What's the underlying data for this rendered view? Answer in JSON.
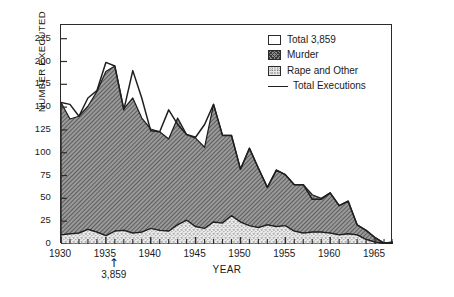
{
  "chart_data": {
    "type": "area",
    "title": "",
    "xlabel": "YEAR",
    "ylabel": "NUMBER EXECUTED",
    "xlim": [
      1930,
      1967
    ],
    "ylim": [
      0,
      240
    ],
    "x_ticks": [
      1930,
      1935,
      1940,
      1945,
      1950,
      1955,
      1960,
      1965
    ],
    "x_minor_tick_interval": 1,
    "y_ticks": [
      0,
      25,
      50,
      75,
      100,
      125,
      150,
      175,
      200,
      225
    ],
    "grid": false,
    "legend_position": "top-right",
    "stacked": true,
    "x": [
      1930,
      1931,
      1932,
      1933,
      1934,
      1935,
      1936,
      1937,
      1938,
      1939,
      1940,
      1941,
      1942,
      1943,
      1944,
      1945,
      1946,
      1947,
      1948,
      1949,
      1950,
      1951,
      1952,
      1953,
      1954,
      1955,
      1956,
      1957,
      1958,
      1959,
      1960,
      1961,
      1962,
      1963,
      1964,
      1965,
      1966,
      1967
    ],
    "series": [
      {
        "name": "Rape and Other",
        "pattern": "stipple",
        "color": "#e8e8e8",
        "values": [
          10,
          11,
          12,
          16,
          13,
          9,
          14,
          15,
          12,
          13,
          17,
          15,
          14,
          21,
          26,
          19,
          17,
          24,
          23,
          31,
          24,
          20,
          18,
          21,
          19,
          20,
          14,
          12,
          13,
          13,
          12,
          10,
          11,
          10,
          5,
          2,
          1,
          1
        ]
      },
      {
        "name": "Murder",
        "pattern": "hatch",
        "color": "#8c8c8c",
        "values": [
          145,
          126,
          128,
          135,
          154,
          180,
          181,
          133,
          148,
          125,
          109,
          108,
          101,
          117,
          94,
          97,
          89,
          129,
          96,
          88,
          58,
          85,
          65,
          41,
          62,
          56,
          51,
          53,
          41,
          37,
          44,
          32,
          36,
          11,
          10,
          5,
          0,
          1
        ]
      }
    ],
    "total_line": {
      "name": "Total Executions",
      "values": [
        155,
        153,
        140,
        160,
        168,
        199,
        195,
        147,
        190,
        160,
        124,
        123,
        147,
        131,
        120,
        117,
        131,
        153,
        119,
        119,
        82,
        105,
        83,
        62,
        81,
        76,
        65,
        65,
        49,
        49,
        56,
        42,
        47,
        21,
        15,
        7,
        1,
        2
      ]
    },
    "legend": [
      {
        "label": "Total 3,859",
        "kind": "box-white"
      },
      {
        "label": "Murder",
        "kind": "box-hatch"
      },
      {
        "label": "Rape and Other",
        "kind": "box-stipple"
      },
      {
        "label": "Total Executions",
        "kind": "line"
      }
    ],
    "annotations": [
      {
        "text": "3,859",
        "marker": "up-arrow",
        "x": 1936,
        "position": "below-axis"
      }
    ]
  }
}
